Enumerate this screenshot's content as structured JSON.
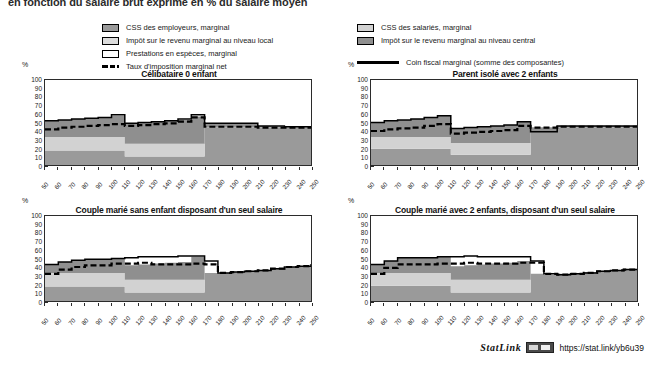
{
  "figure": {
    "title": "en fonction du salaire brut exprimé en % du salaire moyen",
    "y_unit": "%"
  },
  "legend": {
    "left_items": [
      {
        "label": "CSS des employeurs, marginal",
        "marker": "swatch",
        "color": "#9a9a9a",
        "name": "legend-swatch-css-employeurs"
      },
      {
        "label": "Impôt sur le revenu marginal au niveau local",
        "marker": "swatch",
        "color": "#dcdcdc",
        "name": "legend-swatch-impot-local"
      },
      {
        "label": "Prestations en espèces, marginal",
        "marker": "swatch",
        "color": "#ffffff",
        "name": "legend-swatch-prestations"
      },
      {
        "label": "Taux d'imposition marginal net",
        "marker": "dashed-line",
        "color": "#000000",
        "name": "legend-line-taux-imposition"
      }
    ],
    "right_items": [
      {
        "label": "CSS des salariés, marginal",
        "marker": "swatch",
        "color": "#d2d2d2",
        "name": "legend-swatch-css-salaries"
      },
      {
        "label": "Impôt sur le revenu marginal au niveau central",
        "marker": "swatch",
        "color": "#8f8f8f",
        "name": "legend-swatch-impot-central"
      },
      {
        "label": "Coin fiscal marginal (somme des composantes)",
        "marker": "solid-line",
        "color": "#000000",
        "name": "legend-line-coin-fiscal"
      }
    ]
  },
  "footer": {
    "statlink_word": "StatLink",
    "statlink_url": "https://stat.link/yb6u39",
    "badge_name": "statlink-badge-icon"
  },
  "chart_data": [
    {
      "type": "area",
      "id": "celibataire-0-enfant",
      "title": "Célibataire 0 enfant",
      "xlabel": "",
      "ylabel": "%",
      "ylim": [
        0,
        100
      ],
      "xlim": [
        50,
        250
      ],
      "grid": false,
      "legend_position": "top-external",
      "x": [
        50,
        60,
        70,
        80,
        90,
        100,
        110,
        120,
        130,
        140,
        150,
        160,
        170,
        180,
        190,
        200,
        210,
        220,
        230,
        240,
        250
      ],
      "xtick_labels": [
        "50",
        "60",
        "70",
        "80",
        "90",
        "100",
        "110",
        "120",
        "130",
        "140",
        "150",
        "160",
        "170",
        "180",
        "190",
        "200",
        "210",
        "220",
        "230",
        "240",
        "250"
      ],
      "ytick_labels": [
        "0",
        "10",
        "20",
        "30",
        "40",
        "50",
        "60",
        "70",
        "80",
        "90",
        "100"
      ],
      "series": [
        {
          "name": "CSS des employeurs, marginal",
          "color": "#9a9a9a",
          "values": [
            17,
            17,
            17,
            17,
            17,
            17,
            10,
            10,
            10,
            10,
            10,
            10,
            44,
            44,
            44,
            44,
            44,
            44,
            44,
            44,
            44
          ]
        },
        {
          "name": "CSS des salariés, marginal",
          "color": "#d2d2d2",
          "values": [
            16,
            16,
            16,
            16,
            16,
            16,
            15,
            15,
            15,
            15,
            15,
            15,
            0,
            0,
            0,
            0,
            0,
            0,
            0,
            0,
            0
          ]
        },
        {
          "name": "Impôt sur le revenu marginal au niveau central",
          "color": "#8f8f8f",
          "values": [
            19,
            20,
            21,
            22,
            23,
            25,
            24,
            25,
            26,
            27,
            28,
            32,
            5,
            5,
            5,
            5,
            2,
            1,
            1,
            1,
            1
          ]
        },
        {
          "name": "Prestations en espèces, marginal",
          "color": "#ffffff",
          "values": [
            0,
            0,
            0,
            0,
            0,
            0,
            0,
            0,
            0,
            0,
            0,
            0,
            0,
            0,
            0,
            0,
            0,
            0,
            0,
            0,
            0
          ]
        }
      ],
      "lines": [
        {
          "name": "Coin fiscal marginal (somme des composantes)",
          "style": "solid",
          "color": "#000000",
          "values": [
            52,
            53,
            54,
            55,
            56,
            59,
            49,
            50,
            51,
            52,
            54,
            59,
            49,
            49,
            49,
            49,
            46,
            46,
            45,
            45,
            45
          ]
        },
        {
          "name": "Taux d'imposition marginal net",
          "style": "dashed",
          "color": "#000000",
          "values": [
            42,
            44,
            45,
            46,
            47,
            48,
            46,
            47,
            48,
            49,
            51,
            56,
            45,
            45,
            45,
            45,
            44,
            44,
            44,
            44,
            44
          ]
        }
      ]
    },
    {
      "type": "area",
      "id": "parent-isole-2-enfants",
      "title": "Parent isolé avec 2 enfants",
      "xlabel": "",
      "ylabel": "%",
      "ylim": [
        0,
        100
      ],
      "xlim": [
        50,
        250
      ],
      "grid": false,
      "legend_position": "top-external",
      "x": [
        50,
        60,
        70,
        80,
        90,
        100,
        110,
        120,
        130,
        140,
        150,
        160,
        170,
        180,
        190,
        200,
        210,
        220,
        230,
        240,
        250
      ],
      "xtick_labels": [
        "50",
        "60",
        "70",
        "80",
        "90",
        "100",
        "110",
        "120",
        "130",
        "140",
        "150",
        "160",
        "170",
        "180",
        "190",
        "200",
        "210",
        "220",
        "230",
        "240",
        "250"
      ],
      "ytick_labels": [
        "0",
        "10",
        "20",
        "30",
        "40",
        "50",
        "60",
        "70",
        "80",
        "90",
        "100"
      ],
      "series": [
        {
          "name": "CSS des employeurs, marginal",
          "color": "#9a9a9a",
          "values": [
            19,
            19,
            19,
            19,
            19,
            19,
            12,
            12,
            12,
            12,
            12,
            12,
            44,
            44,
            44,
            44,
            44,
            44,
            44,
            44,
            44
          ]
        },
        {
          "name": "CSS des salariés, marginal",
          "color": "#d2d2d2",
          "values": [
            14,
            14,
            14,
            14,
            14,
            14,
            14,
            14,
            14,
            14,
            14,
            14,
            0,
            0,
            0,
            0,
            0,
            0,
            0,
            0,
            0
          ]
        },
        {
          "name": "Impôt sur le revenu marginal au niveau central",
          "color": "#8f8f8f",
          "values": [
            17,
            19,
            20,
            21,
            23,
            25,
            17,
            18,
            19,
            20,
            21,
            25,
            -5,
            -5,
            2,
            2,
            2,
            2,
            2,
            2,
            2
          ]
        },
        {
          "name": "Prestations en espèces, marginal",
          "color": "#ffffff",
          "values": [
            0,
            0,
            0,
            0,
            0,
            0,
            0,
            0,
            0,
            0,
            0,
            0,
            0,
            0,
            0,
            0,
            0,
            0,
            0,
            0,
            0
          ]
        }
      ],
      "lines": [
        {
          "name": "Coin fiscal marginal (somme des composantes)",
          "style": "solid",
          "color": "#000000",
          "values": [
            50,
            52,
            53,
            54,
            56,
            58,
            43,
            44,
            45,
            46,
            47,
            51,
            39,
            39,
            46,
            46,
            46,
            46,
            46,
            46,
            46
          ]
        },
        {
          "name": "Taux d'imposition marginal net",
          "style": "dashed",
          "color": "#000000",
          "values": [
            40,
            42,
            43,
            44,
            46,
            48,
            37,
            38,
            39,
            40,
            41,
            46,
            44,
            44,
            45,
            45,
            45,
            45,
            45,
            45,
            45
          ]
        }
      ]
    },
    {
      "type": "area",
      "id": "couple-marie-sans-enfant",
      "title": "Couple marié sans enfant disposant d'un seul salaire",
      "xlabel": "",
      "ylabel": "%",
      "ylim": [
        0,
        100
      ],
      "xlim": [
        50,
        250
      ],
      "grid": false,
      "legend_position": "top-external",
      "x": [
        50,
        60,
        70,
        80,
        90,
        100,
        110,
        120,
        130,
        140,
        150,
        160,
        170,
        180,
        190,
        200,
        210,
        220,
        230,
        240,
        250
      ],
      "xtick_labels": [
        "50",
        "60",
        "70",
        "80",
        "90",
        "100",
        "110",
        "120",
        "130",
        "140",
        "150",
        "160",
        "170",
        "180",
        "190",
        "200",
        "210",
        "220",
        "230",
        "240",
        "250"
      ],
      "ytick_labels": [
        "0",
        "10",
        "20",
        "30",
        "40",
        "50",
        "60",
        "70",
        "80",
        "90",
        "100"
      ],
      "series": [
        {
          "name": "CSS des employeurs, marginal",
          "color": "#9a9a9a",
          "values": [
            17,
            17,
            17,
            17,
            17,
            17,
            10,
            10,
            10,
            10,
            10,
            10,
            33,
            33,
            34,
            35,
            36,
            38,
            40,
            41,
            43
          ]
        },
        {
          "name": "CSS des salariés, marginal",
          "color": "#d2d2d2",
          "values": [
            16,
            16,
            16,
            16,
            16,
            16,
            15,
            15,
            15,
            15,
            15,
            15,
            0,
            0,
            0,
            0,
            0,
            0,
            0,
            0,
            0
          ]
        },
        {
          "name": "Impôt sur le revenu marginal au niveau central",
          "color": "#8f8f8f",
          "values": [
            10,
            13,
            15,
            16,
            16,
            17,
            17,
            18,
            19,
            20,
            21,
            27,
            0,
            0,
            0,
            0,
            0,
            0,
            0,
            0,
            0
          ]
        },
        {
          "name": "Prestations en espèces, marginal",
          "color": "#ffffff",
          "values": [
            0,
            0,
            0,
            0,
            0,
            0,
            0,
            0,
            0,
            0,
            0,
            0,
            0,
            0,
            0,
            0,
            0,
            0,
            0,
            0,
            0
          ]
        }
      ],
      "lines": [
        {
          "name": "Coin fiscal marginal (somme des composantes)",
          "style": "solid",
          "color": "#000000",
          "values": [
            43,
            46,
            48,
            49,
            49,
            50,
            51,
            52,
            52,
            52,
            53,
            53,
            47,
            33,
            34,
            35,
            36,
            38,
            40,
            41,
            43
          ]
        },
        {
          "name": "Taux d'imposition marginal net",
          "style": "dashed",
          "color": "#000000",
          "values": [
            32,
            37,
            40,
            42,
            42,
            44,
            44,
            45,
            43,
            43,
            43,
            44,
            43,
            33,
            34,
            35,
            36,
            38,
            40,
            41,
            43
          ]
        }
      ]
    },
    {
      "type": "area",
      "id": "couple-marie-2-enfants",
      "title": "Couple marié avec 2 enfants, disposant d'un seul salaire",
      "xlabel": "",
      "ylabel": "%",
      "ylim": [
        0,
        100
      ],
      "xlim": [
        50,
        250
      ],
      "grid": false,
      "legend_position": "top-external",
      "x": [
        50,
        60,
        70,
        80,
        90,
        100,
        110,
        120,
        130,
        140,
        150,
        160,
        170,
        180,
        190,
        200,
        210,
        220,
        230,
        240,
        250
      ],
      "xtick_labels": [
        "50",
        "60",
        "70",
        "80",
        "90",
        "100",
        "110",
        "120",
        "130",
        "140",
        "150",
        "160",
        "170",
        "180",
        "190",
        "200",
        "210",
        "220",
        "230",
        "240",
        "250"
      ],
      "ytick_labels": [
        "0",
        "10",
        "20",
        "30",
        "40",
        "50",
        "60",
        "70",
        "80",
        "90",
        "100"
      ],
      "series": [
        {
          "name": "CSS des employeurs, marginal",
          "color": "#9a9a9a",
          "values": [
            18,
            18,
            18,
            18,
            18,
            18,
            10,
            10,
            10,
            10,
            10,
            10,
            32,
            31,
            32,
            33,
            34,
            35,
            36,
            37,
            38
          ]
        },
        {
          "name": "CSS des salariés, marginal",
          "color": "#d2d2d2",
          "values": [
            15,
            15,
            15,
            15,
            15,
            15,
            15,
            15,
            15,
            15,
            15,
            15,
            0,
            0,
            0,
            0,
            0,
            0,
            0,
            0,
            0
          ]
        },
        {
          "name": "Impôt sur le revenu marginal au niveau central",
          "color": "#8f8f8f",
          "values": [
            10,
            14,
            18,
            18,
            18,
            19,
            16,
            17,
            18,
            19,
            20,
            22,
            0,
            0,
            0,
            0,
            0,
            0,
            0,
            0,
            0
          ]
        },
        {
          "name": "Prestations en espèces, marginal",
          "color": "#ffffff",
          "values": [
            0,
            0,
            0,
            0,
            0,
            0,
            0,
            0,
            0,
            0,
            0,
            0,
            0,
            0,
            0,
            0,
            0,
            0,
            0,
            0,
            0
          ]
        }
      ],
      "lines": [
        {
          "name": "Coin fiscal marginal (somme des composantes)",
          "style": "solid",
          "color": "#000000",
          "values": [
            43,
            47,
            51,
            51,
            51,
            52,
            52,
            53,
            52,
            52,
            52,
            52,
            47,
            32,
            31,
            32,
            33,
            35,
            36,
            37,
            38
          ]
        },
        {
          "name": "Taux d'imposition marginal net",
          "style": "dashed",
          "color": "#000000",
          "values": [
            32,
            39,
            43,
            43,
            43,
            44,
            44,
            45,
            44,
            44,
            44,
            45,
            45,
            32,
            31,
            32,
            33,
            35,
            36,
            37,
            38
          ]
        }
      ]
    }
  ]
}
